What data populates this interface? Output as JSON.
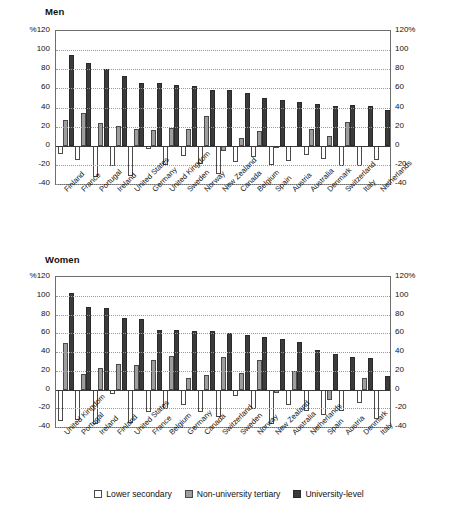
{
  "legend": {
    "items": [
      {
        "label": "Lower secondary",
        "key": "lower",
        "color": "#ffffff"
      },
      {
        "label": "Non-university tertiary",
        "key": "nonuni",
        "color": "#9e9e9e"
      },
      {
        "label": "University-level",
        "key": "uni",
        "color": "#3b3b3b"
      }
    ]
  },
  "axis": {
    "top_left_label": "%120",
    "top_right_label": "120%",
    "ticks": [
      120,
      100,
      80,
      60,
      40,
      20,
      0,
      -20,
      -40
    ],
    "tick_labels_left": [
      "%120",
      "100",
      "80",
      "60",
      "40",
      "20",
      "0",
      "-20",
      "-40"
    ],
    "tick_labels_right": [
      "120%",
      "100",
      "80",
      "60",
      "40",
      "20",
      "0",
      "-20",
      "-40"
    ],
    "min": -40,
    "max": 120
  },
  "panels": {
    "men": {
      "title": "Men"
    },
    "women": {
      "title": "Women"
    }
  },
  "chart_data": [
    {
      "type": "bar",
      "title": "Men",
      "xlabel": "",
      "ylabel": "%",
      "ylim": [
        -40,
        120
      ],
      "grid": true,
      "legend_position": "bottom",
      "categories": [
        "Finland",
        "France",
        "Portugal",
        "Ireland",
        "United States",
        "Germany",
        "United Kingdom",
        "Sweden",
        "Norway",
        "New Zealand",
        "Canada",
        "Belgium",
        "Spain",
        "Austria",
        "Australia",
        "Denmark",
        "Switzerland",
        "Italy",
        "Netherlands"
      ],
      "series": [
        {
          "name": "Lower secondary",
          "values": [
            -9,
            -15,
            -33,
            -21,
            -32,
            -3,
            -20,
            -11,
            -19,
            -30,
            -17,
            -12,
            -20,
            -16,
            -10,
            -14,
            -21,
            -21,
            -15
          ]
        },
        {
          "name": "Non-university tertiary",
          "values": [
            27,
            34,
            24,
            21,
            17,
            16,
            19,
            17,
            31,
            -6,
            8,
            15,
            -2,
            0,
            17,
            10,
            25,
            0,
            0
          ]
        },
        {
          "name": "University-level",
          "values": [
            95,
            87,
            80,
            73,
            66,
            66,
            64,
            63,
            58,
            58,
            55,
            50,
            48,
            46,
            44,
            42,
            43,
            42,
            37
          ]
        }
      ]
    },
    {
      "type": "bar",
      "title": "Women",
      "xlabel": "",
      "ylabel": "%",
      "ylim": [
        -40,
        120
      ],
      "grid": true,
      "legend_position": "bottom",
      "categories": [
        "United Kingdom",
        "Portugal",
        "Ireland",
        "Finland",
        "United States",
        "France",
        "Belgium",
        "Germany",
        "Canada",
        "Switzerland",
        "Sweden",
        "Norway",
        "New Zealand",
        "Australia",
        "Netherlands",
        "Spain",
        "Austria",
        "Denmark",
        "Italy"
      ],
      "series": [
        {
          "name": "Lower secondary",
          "values": [
            -34,
            -32,
            -37,
            -5,
            -36,
            -24,
            -21,
            -17,
            -24,
            -29,
            -7,
            -21,
            -37,
            -17,
            -23,
            -27,
            -23,
            -14,
            -31
          ]
        },
        {
          "name": "Non-university tertiary",
          "values": [
            50,
            17,
            23,
            27,
            26,
            31,
            36,
            12,
            15,
            35,
            18,
            32,
            -4,
            20,
            0,
            -11,
            0,
            12,
            0
          ]
        },
        {
          "name": "University-level",
          "values": [
            103,
            88,
            87,
            76,
            75,
            64,
            63,
            62,
            62,
            60,
            58,
            56,
            54,
            51,
            42,
            38,
            35,
            34,
            14
          ]
        }
      ]
    }
  ]
}
